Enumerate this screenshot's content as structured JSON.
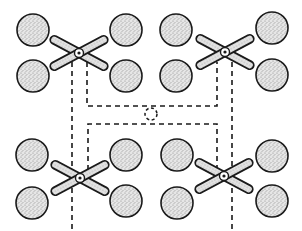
{
  "diagram": {
    "width": 302,
    "height": 231,
    "colors": {
      "background": "#ffffff",
      "stroke": "#1a1a1a",
      "fill_stipple": "#cfcfcf",
      "arm_fill": "#d8d8d8"
    },
    "circle_radius": 16,
    "arm_length": 32,
    "arm_width": 8,
    "groups": [
      {
        "name": "top-left",
        "hub": {
          "x": 79,
          "y": 53
        },
        "circles": [
          {
            "x": 33,
            "y": 30
          },
          {
            "x": 33,
            "y": 76
          },
          {
            "x": 126,
            "y": 30
          },
          {
            "x": 126,
            "y": 76
          }
        ]
      },
      {
        "name": "top-right",
        "hub": {
          "x": 225,
          "y": 52
        },
        "circles": [
          {
            "x": 176,
            "y": 30
          },
          {
            "x": 176,
            "y": 76
          },
          {
            "x": 272,
            "y": 28
          },
          {
            "x": 272,
            "y": 75
          }
        ]
      },
      {
        "name": "bottom-left",
        "hub": {
          "x": 80,
          "y": 178
        },
        "circles": [
          {
            "x": 32,
            "y": 155
          },
          {
            "x": 32,
            "y": 203
          },
          {
            "x": 126,
            "y": 155
          },
          {
            "x": 126,
            "y": 201
          }
        ]
      },
      {
        "name": "bottom-right",
        "hub": {
          "x": 224,
          "y": 176
        },
        "circles": [
          {
            "x": 177,
            "y": 155
          },
          {
            "x": 177,
            "y": 203
          },
          {
            "x": 272,
            "y": 156
          },
          {
            "x": 272,
            "y": 201
          }
        ]
      }
    ],
    "center_marker": {
      "x": 151,
      "y": 114,
      "r": 6
    },
    "dashed_paths": [
      "M72 62 L72 231",
      "M87 62 L87 106 L217 106 L217 62",
      "M232 62 L232 231",
      "M88 170 L88 124 L217 124 L217 168"
    ]
  }
}
